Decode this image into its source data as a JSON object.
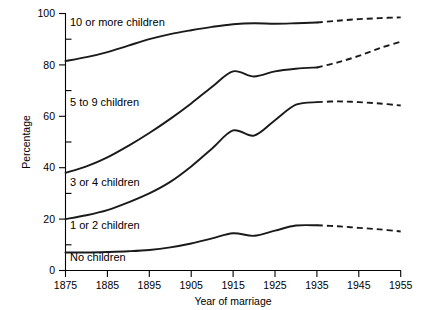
{
  "chart_data": {
    "type": "line",
    "title": "",
    "xlabel": "Year of marriage",
    "ylabel": "Percentage",
    "xlim": [
      1875,
      1955
    ],
    "ylim": [
      0,
      100
    ],
    "grid": false,
    "legend_position": "inline-labels",
    "x_ticks": [
      1875,
      1885,
      1895,
      1905,
      1915,
      1925,
      1935,
      1945,
      1955
    ],
    "y_ticks": [
      0,
      20,
      40,
      60,
      80,
      100
    ],
    "y_minor_ticks": [
      10,
      30,
      50,
      70,
      90
    ],
    "note": "Cumulative percentage curves; solid to 1935, dashed projection 1935-1955",
    "projection_start_year": 1935,
    "x": [
      1875,
      1880,
      1885,
      1890,
      1895,
      1900,
      1905,
      1910,
      1915,
      1920,
      1925,
      1930,
      1935,
      1940,
      1945,
      1950,
      1955
    ],
    "series": [
      {
        "name": "10 or more children",
        "label": "10 or more children",
        "values": [
          81.5,
          83.0,
          85.0,
          87.5,
          90.0,
          92.0,
          93.5,
          94.8,
          95.8,
          96.2,
          96.0,
          96.2,
          96.5,
          97.2,
          97.8,
          98.2,
          98.5
        ]
      },
      {
        "name": "5 to 9 children",
        "label": "5 to 9 children",
        "values": [
          38.0,
          40.5,
          44.0,
          48.5,
          53.5,
          59.0,
          65.0,
          71.5,
          77.5,
          75.5,
          77.5,
          78.5,
          79.0,
          81.0,
          83.5,
          86.5,
          89.0
        ]
      },
      {
        "name": "3 or 4 children",
        "label": "3 or 4 children",
        "values": [
          20.0,
          21.5,
          23.5,
          26.5,
          30.0,
          34.5,
          40.5,
          47.5,
          54.5,
          52.5,
          58.5,
          64.5,
          65.5,
          65.8,
          65.5,
          65.0,
          64.2
        ]
      },
      {
        "name": "1 or 2 children",
        "label": "1 or 2 children",
        "values": [
          7.0,
          7.0,
          7.2,
          7.5,
          8.0,
          9.0,
          10.5,
          12.5,
          14.5,
          13.5,
          15.5,
          17.5,
          17.6,
          17.2,
          16.6,
          16.0,
          15.2
        ]
      },
      {
        "name": "No children",
        "label": "No children",
        "values": [
          0,
          0,
          0,
          0,
          0,
          0,
          0,
          0,
          0,
          0,
          0,
          0,
          0,
          0,
          0,
          0,
          0
        ]
      }
    ]
  },
  "axes": {
    "y_label": "Percentage",
    "x_label": "Year of marriage",
    "y_tick_labels": [
      "100",
      "80",
      "60",
      "40",
      "20",
      "0"
    ],
    "x_tick_labels": [
      "1875",
      "1885",
      "1895",
      "1905",
      "1915",
      "1925",
      "1935",
      "1945",
      "1955"
    ]
  },
  "series_labels": {
    "s0": "10 or more children",
    "s1": "5 to 9 children",
    "s2": "3 or 4 children",
    "s3": "1 or 2 children",
    "s4": "No children"
  },
  "colors": {
    "line": "#1a1a1a",
    "axis": "#000000",
    "background": "#ffffff"
  }
}
